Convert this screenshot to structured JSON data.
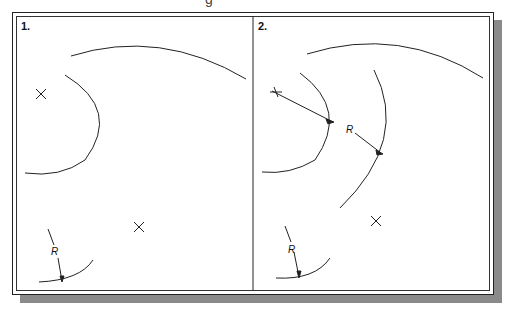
{
  "figure": {
    "top_cut_text": "g",
    "panels": [
      {
        "label": "1.",
        "dimension_label": "R"
      },
      {
        "label": "2.",
        "dimension_label": "R",
        "dimension_label_2": "R"
      }
    ],
    "colors": {
      "line": "#222222",
      "shadow": "#8a8a8a",
      "background": "#ffffff"
    }
  }
}
